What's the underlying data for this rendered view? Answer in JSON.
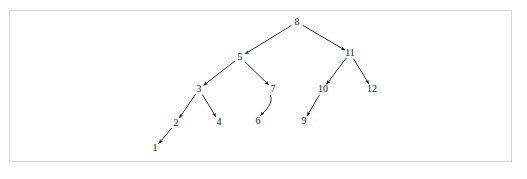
{
  "figure": {
    "kind": "binary-search-tree-diagram",
    "frame_border_color": "#d8d8d8",
    "background_color": "#ffffff",
    "edge_color": "#1a1a1a",
    "label_color": "#1a1a1a"
  },
  "chart_data": {
    "type": "diagram",
    "title": "",
    "xlabel": "",
    "ylabel": "",
    "grid": false,
    "legend": null,
    "nodes": [
      {
        "id": "n8",
        "label": "8",
        "x": 297,
        "y": 22,
        "level": 0
      },
      {
        "id": "n5",
        "label": "5",
        "x": 240,
        "y": 57,
        "level": 1
      },
      {
        "id": "n11",
        "label": "11",
        "x": 350,
        "y": 53,
        "level": 1
      },
      {
        "id": "n3",
        "label": "3",
        "x": 199,
        "y": 89,
        "level": 2
      },
      {
        "id": "n7",
        "label": "7",
        "x": 273,
        "y": 89,
        "level": 2
      },
      {
        "id": "n10",
        "label": "10",
        "x": 323,
        "y": 89,
        "level": 2
      },
      {
        "id": "n12",
        "label": "12",
        "x": 372,
        "y": 89,
        "level": 2
      },
      {
        "id": "n2",
        "label": "2",
        "x": 176,
        "y": 123,
        "level": 3
      },
      {
        "id": "n4",
        "label": "4",
        "x": 219,
        "y": 122,
        "level": 3
      },
      {
        "id": "n6",
        "label": "6",
        "x": 258,
        "y": 121,
        "level": 3
      },
      {
        "id": "n9",
        "label": "9",
        "x": 304,
        "y": 121,
        "level": 3
      },
      {
        "id": "n1",
        "label": "1",
        "x": 155,
        "y": 148,
        "level": 4
      }
    ],
    "edges": [
      {
        "from": "n8",
        "to": "n5",
        "arrow": true,
        "curved": false
      },
      {
        "from": "n8",
        "to": "n11",
        "arrow": true,
        "curved": false
      },
      {
        "from": "n5",
        "to": "n3",
        "arrow": true,
        "curved": false
      },
      {
        "from": "n5",
        "to": "n7",
        "arrow": true,
        "curved": false
      },
      {
        "from": "n11",
        "to": "n10",
        "arrow": true,
        "curved": false
      },
      {
        "from": "n11",
        "to": "n12",
        "arrow": true,
        "curved": false
      },
      {
        "from": "n3",
        "to": "n2",
        "arrow": true,
        "curved": false
      },
      {
        "from": "n3",
        "to": "n4",
        "arrow": true,
        "curved": false
      },
      {
        "from": "n7",
        "to": "n6",
        "arrow": true,
        "curved": true
      },
      {
        "from": "n10",
        "to": "n9",
        "arrow": true,
        "curved": false
      },
      {
        "from": "n2",
        "to": "n1",
        "arrow": true,
        "curved": false
      }
    ]
  }
}
